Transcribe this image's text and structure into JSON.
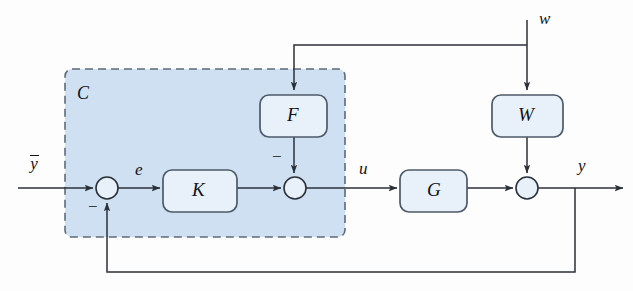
{
  "diagram": {
    "type": "control-block-diagram",
    "colors": {
      "background": "#fdfdfd",
      "region_fill": "#cfe0f2",
      "region_border": "#5d6b7a",
      "block_fill": "#e8f1f9",
      "block_border": "#4d5a67",
      "line": "#2b3138",
      "text": "#111317"
    },
    "region": {
      "label": "C",
      "style": "dashed",
      "x": 65,
      "y": 69,
      "width": 280,
      "height": 168
    },
    "blocks": [
      {
        "name": "K",
        "label": "K",
        "x": 163,
        "y": 170,
        "width": 74,
        "height": 42
      },
      {
        "name": "F",
        "label": "F",
        "x": 260,
        "y": 95,
        "width": 67,
        "height": 42
      },
      {
        "name": "G",
        "label": "G",
        "x": 400,
        "y": 170,
        "width": 67,
        "height": 42
      },
      {
        "name": "W",
        "label": "W",
        "x": 492,
        "y": 95,
        "width": 71,
        "height": 42
      }
    ],
    "summing_junctions": [
      {
        "name": "error-sum",
        "cx": 107,
        "cy": 188,
        "r": 11
      },
      {
        "name": "control-sum",
        "cx": 295,
        "cy": 188,
        "r": 11
      },
      {
        "name": "output-sum",
        "cx": 527,
        "cy": 188,
        "r": 11
      }
    ],
    "signals": {
      "reference": "y",
      "reference_accent": "overline",
      "error": "e",
      "control": "u",
      "disturbance": "w",
      "output": "y"
    },
    "signs": [
      {
        "name": "error-sum-minus",
        "symbol": "−",
        "x": 88,
        "y": 199
      },
      {
        "name": "control-sum-minus",
        "symbol": "−",
        "x": 272,
        "y": 150
      }
    ]
  }
}
